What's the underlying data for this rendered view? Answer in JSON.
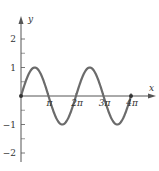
{
  "chart_data": {
    "type": "line",
    "title": "",
    "xlabel": "x",
    "ylabel": "y",
    "function": "y = sin(x)",
    "xlim": [
      0,
      12.566
    ],
    "ylim": [
      -2,
      2
    ],
    "x_ticks": [
      {
        "value": 3.1416,
        "label": "π"
      },
      {
        "value": 6.2832,
        "label": "2π"
      },
      {
        "value": 9.4248,
        "label": "3π"
      },
      {
        "value": 12.5664,
        "label": "4π"
      }
    ],
    "x_tick_labels": [
      "π",
      "2π",
      "3π",
      "4π"
    ],
    "y_ticks": [
      2,
      1,
      0,
      -1,
      -2
    ],
    "y_tick_labels": [
      "2",
      "1",
      "−1",
      "−2"
    ],
    "y_minor_ticks": [
      1.5,
      0.5,
      -0.5,
      -1.5
    ],
    "series": [
      {
        "name": "sin x",
        "x": [
          0,
          1.5708,
          3.1416,
          4.7124,
          6.2832,
          7.854,
          9.4248,
          10.9956,
          12.5664
        ],
        "values": [
          0,
          1,
          0,
          -1,
          0,
          1,
          0,
          -1,
          0
        ]
      }
    ],
    "points_marked": [
      {
        "x": 0,
        "y": 0
      },
      {
        "x": 12.5664,
        "y": 0
      }
    ],
    "grid": false,
    "legend": null,
    "colors": {
      "curve": "#6b6b6b",
      "axes": "#555555",
      "text": "#333333"
    }
  }
}
